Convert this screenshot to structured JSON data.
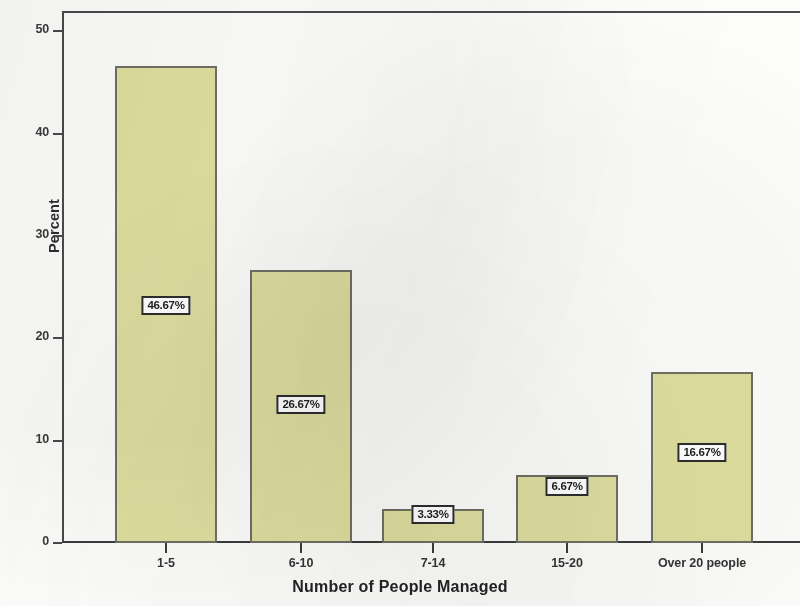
{
  "chart_data": {
    "type": "bar",
    "title": "",
    "subtitle": "",
    "xlabel": "Number of People Managed",
    "ylabel": "Percent",
    "categories": [
      "1-5",
      "6-10",
      "7-14",
      "15-20",
      "Over 20 people"
    ],
    "values": [
      46.67,
      26.67,
      3.33,
      6.67,
      16.67
    ],
    "data_labels": [
      "46.67%",
      "26.67%",
      "3.33%",
      "6.67%",
      "16.67%"
    ],
    "ylim": [
      0,
      52
    ],
    "y_ticks": [
      "0",
      "10",
      "20",
      "30",
      "40",
      "50"
    ],
    "y_tick_values": [
      0,
      10,
      20,
      30,
      40,
      50
    ],
    "grid": false,
    "legend": false,
    "legend_position": "none",
    "bar_color": "#dfdfa0",
    "bar_border_color": "#6f6f63",
    "axis_color": "#3b3b3b",
    "label_box_border_color": "#2d2d2d",
    "label_box_fill": "#ffffff"
  }
}
